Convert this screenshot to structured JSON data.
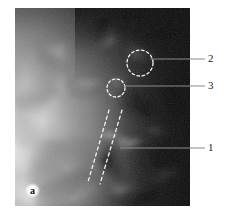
{
  "figure": {
    "panel_letter": "a",
    "type": "grayscale-medical-image",
    "modality_appearance": "radiograph/ultrasound grayscale",
    "frame": {
      "x": 15,
      "y": 8,
      "width": 175,
      "height": 198
    },
    "background_color": "#ffffff",
    "annotation_color": "#f2f2f2",
    "leader_color": "#888888",
    "label_color": "#1a1a1a"
  },
  "annotations": {
    "circles": [
      {
        "id": "circle-2",
        "label": "2",
        "style": "dashed",
        "cx": 140,
        "cy": 63,
        "r": 13
      },
      {
        "id": "circle-3",
        "label": "3",
        "style": "dashed",
        "cx": 116,
        "cy": 88,
        "r": 9
      }
    ],
    "dashed_lines": [
      {
        "id": "dashed-line-left",
        "label": "1",
        "x1": 109,
        "y1": 110,
        "x2": 88,
        "y2": 182
      },
      {
        "id": "dashed-line-right",
        "label": "1",
        "x1": 122,
        "y1": 110,
        "x2": 100,
        "y2": 184
      }
    ],
    "leaders": [
      {
        "id": "leader-2",
        "label": "2",
        "x1": 150,
        "y1": 59,
        "x2": 205,
        "y2": 59
      },
      {
        "id": "leader-3",
        "label": "3",
        "x1": 124,
        "y1": 86,
        "x2": 205,
        "y2": 86
      },
      {
        "id": "leader-1",
        "label": "1",
        "x1": 120,
        "y1": 148,
        "x2": 205,
        "y2": 148
      }
    ]
  },
  "labels": {
    "one": "1",
    "two": "2",
    "three": "3"
  }
}
